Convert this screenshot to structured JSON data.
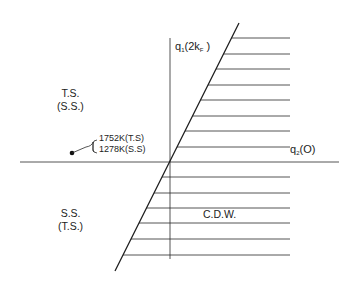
{
  "axes": {
    "vertical_label": {
      "main": "q",
      "sub": "1",
      "arg_open": "(2k",
      "arg_sub": "F",
      "arg_close": " )"
    },
    "horizontal_label": {
      "main": "q",
      "sub": "2",
      "arg": "(O)"
    }
  },
  "regions": {
    "upper_left": {
      "line1": "T.S.",
      "line2": "(S.S.)"
    },
    "lower_left": {
      "line1": "S.S.",
      "line2": "(T.S.)"
    },
    "right": {
      "label": "C.D.W."
    }
  },
  "annotation": {
    "line1": "1752K(T.S)",
    "line2": "1278K(S.S)"
  },
  "colors": {
    "ink": "#1c1c1c",
    "background": "#ffffff"
  }
}
